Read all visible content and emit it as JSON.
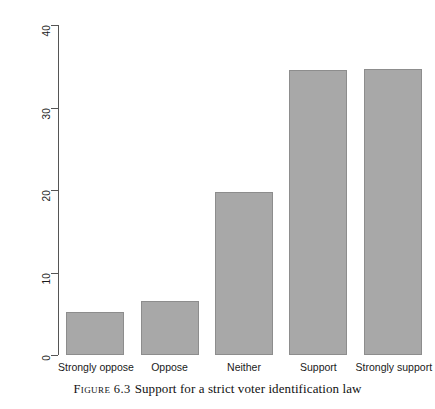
{
  "figure": {
    "caption_label": "Figure 6.3",
    "caption_text": "Support for a strict voter identification law"
  },
  "chart_data": {
    "type": "bar",
    "title": "",
    "xlabel": "",
    "ylabel": "Percent",
    "categories": [
      "Strongly oppose",
      "Oppose",
      "Neither",
      "Support",
      "Strongly support"
    ],
    "values": [
      5.2,
      6.6,
      19.8,
      34.6,
      34.7
    ],
    "ylim": [
      0,
      40
    ],
    "yticks": [
      0,
      10,
      20,
      30,
      40
    ],
    "ytick_labels": [
      "0",
      "10",
      "20",
      "30",
      "40"
    ],
    "grid": false,
    "legend": "none",
    "bar_color": "#a8a8a8",
    "bar_border_color": "#8d8d8d",
    "axis_color": "#555555",
    "background": "#ffffff"
  }
}
